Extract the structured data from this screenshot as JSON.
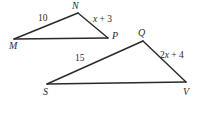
{
  "figure": {
    "stroke_color": "#2a2a2e",
    "text_color": "#2b2b2f",
    "background_color": "#ffffff",
    "triangles": [
      {
        "name": "triangle-MNP",
        "vertices": [
          {
            "label": "M",
            "x": 14,
            "y": 39
          },
          {
            "label": "N",
            "x": 78,
            "y": 13
          },
          {
            "label": "P",
            "x": 108,
            "y": 38
          }
        ],
        "side_labels": [
          {
            "name": "side-MN",
            "text": "10"
          },
          {
            "name": "side-NP",
            "text": "x + 3"
          }
        ]
      },
      {
        "name": "triangle-SQV",
        "vertices": [
          {
            "label": "S",
            "x": 47,
            "y": 84
          },
          {
            "label": "Q",
            "x": 143,
            "y": 41
          },
          {
            "label": "V",
            "x": 186,
            "y": 82
          }
        ],
        "side_labels": [
          {
            "name": "side-SQ",
            "text": "15"
          },
          {
            "name": "side-QV",
            "text": "2x + 4"
          }
        ]
      }
    ],
    "vertex_labels": {
      "m": "M",
      "n": "N",
      "p": "P",
      "q": "Q",
      "s": "S",
      "v": "V"
    },
    "measure_labels": {
      "mn": "10",
      "np_var": "x",
      "np_rest": " + 3",
      "sq": "15",
      "qv_coef": "2",
      "qv_var": "x",
      "qv_rest": " + 4"
    }
  }
}
